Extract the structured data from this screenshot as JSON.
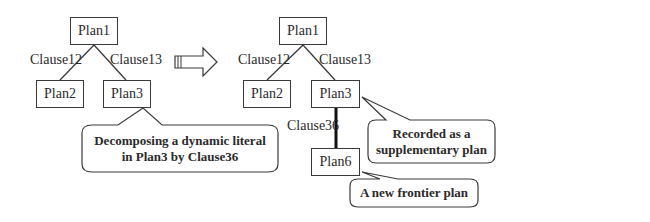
{
  "before_tree": {
    "root": "Plan1",
    "children": [
      {
        "node": "Plan2",
        "edge": "Clause12"
      },
      {
        "node": "Plan3",
        "edge": "Clause13"
      }
    ],
    "callout": {
      "line1": "Decomposing a dynamic literal",
      "line2": "in Plan3 by Clause36"
    }
  },
  "transition_arrow": "right-arrow",
  "after_tree": {
    "root": "Plan1",
    "children": [
      {
        "node": "Plan2",
        "edge": "Clause12"
      },
      {
        "node": "Plan3",
        "edge": "Clause13"
      }
    ],
    "grandchild": {
      "node": "Plan6",
      "edge": "Clause36",
      "parent": "Plan3"
    },
    "callout_plan3": {
      "line1": "Recorded as a",
      "line2": "supplementary plan"
    },
    "callout_plan6": {
      "line1": "A new frontier plan"
    }
  },
  "colors": {
    "stroke": "#3a3a3a",
    "thick_edge": "#111111",
    "text": "#2a2a2a"
  }
}
